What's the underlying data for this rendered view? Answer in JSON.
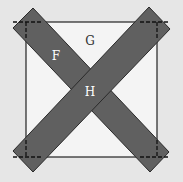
{
  "diagram": {
    "background_color": "#e6e6e6",
    "square": {
      "x": 26,
      "y": 22,
      "width": 131,
      "height": 135,
      "fill": "#f4f4f4",
      "stroke": "#222222"
    },
    "strips": [
      {
        "name": "strip-diagonal-a",
        "points": "33,8 13,28 150,172 169,152",
        "fill": "#606060",
        "stroke": "#2a2a2a"
      },
      {
        "name": "strip-diagonal-b",
        "points": "149,7 170,29 33,172 13,151",
        "fill": "#606060",
        "stroke": "#2a2a2a"
      }
    ],
    "dashed_lines": [
      {
        "x1": 13,
        "y1": 22,
        "x2": 42,
        "y2": 22
      },
      {
        "x1": 26,
        "y1": 22,
        "x2": 26,
        "y2": 40
      },
      {
        "x1": 140,
        "y1": 22,
        "x2": 170,
        "y2": 22
      },
      {
        "x1": 157,
        "y1": 22,
        "x2": 157,
        "y2": 40
      },
      {
        "x1": 13,
        "y1": 157,
        "x2": 42,
        "y2": 157
      },
      {
        "x1": 26,
        "y1": 140,
        "x2": 26,
        "y2": 157
      },
      {
        "x1": 140,
        "y1": 157,
        "x2": 170,
        "y2": 157
      },
      {
        "x1": 157,
        "y1": 140,
        "x2": 157,
        "y2": 157
      }
    ],
    "labels": [
      {
        "name": "label-f",
        "text": "F",
        "x": 56,
        "y": 60,
        "color": "#ffffff"
      },
      {
        "name": "label-g",
        "text": "G",
        "x": 90,
        "y": 45,
        "color": "#333333"
      },
      {
        "name": "label-h",
        "text": "H",
        "x": 90,
        "y": 96,
        "color": "#ffffff"
      }
    ]
  }
}
